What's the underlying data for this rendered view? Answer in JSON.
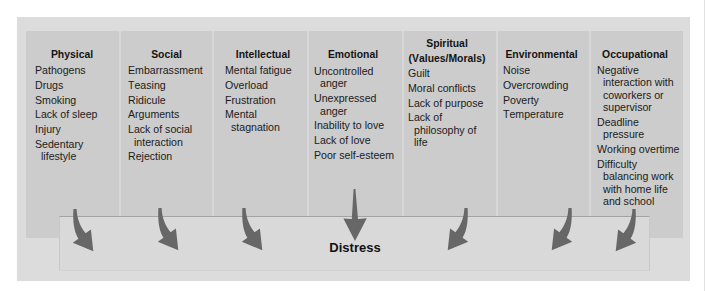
{
  "diagram": {
    "categories": [
      {
        "heading": "Physical",
        "items": [
          "Pathogens",
          "Drugs",
          "Smoking",
          "Lack of sleep",
          "Injury",
          "Sedentary lifestyle"
        ]
      },
      {
        "heading": "Social",
        "items": [
          "Embarrassment",
          "Teasing",
          "Ridicule",
          "Arguments",
          "Lack of social interaction",
          "Rejection"
        ]
      },
      {
        "heading": "Intellectual",
        "items": [
          "Mental fatigue",
          "Overload",
          "Frustration",
          "Mental stagnation"
        ]
      },
      {
        "heading": "Emotional",
        "items": [
          "Uncontrolled anger",
          "Unexpressed anger",
          "Inability to love",
          "Lack of love",
          "Poor self-esteem"
        ]
      },
      {
        "heading": "Spiritual",
        "subheading": "(Values/Morals)",
        "items": [
          "Guilt",
          "Moral conflicts",
          "Lack of purpose",
          "Lack of philosophy of life"
        ]
      },
      {
        "heading": "Environmental",
        "items": [
          "Noise",
          "Overcrowding",
          "Poverty",
          "Temperature"
        ]
      },
      {
        "heading": "Occupational",
        "items": [
          "Negative interaction with coworkers or supervisor",
          "Deadline pressure",
          "Working overtime",
          "Difficulty balancing work with home life and school"
        ]
      }
    ],
    "outcome": {
      "label": "Distress"
    },
    "connections": [
      {
        "from": "Physical",
        "to": "Distress"
      },
      {
        "from": "Social",
        "to": "Distress"
      },
      {
        "from": "Intellectual",
        "to": "Distress"
      },
      {
        "from": "Emotional",
        "to": "Distress"
      },
      {
        "from": "Spiritual (Values/Morals)",
        "to": "Distress"
      },
      {
        "from": "Environmental",
        "to": "Distress"
      },
      {
        "from": "Occupational",
        "to": "Distress"
      }
    ]
  },
  "colors": {
    "outer_background": "#dcdcdc",
    "column_panel": "#cccccc",
    "distress_box": "#d9d9d9",
    "arrow": "#676767",
    "text": "#1b1b1b"
  }
}
